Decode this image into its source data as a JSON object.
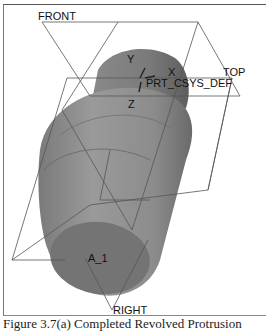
{
  "viewport": {
    "datum_planes": {
      "front": "FRONT",
      "top": "TOP",
      "right": "RIGHT"
    },
    "csys": {
      "name": "PRT_CSYS_DEF",
      "axis_x": "X",
      "axis_y": "Y",
      "axis_z": "Z"
    },
    "axis_label": "A_1",
    "model_color": "#8a8a8a",
    "plane_color": "#555555"
  },
  "caption": "Figure 3.7(a) Completed Revolved Protrusion"
}
